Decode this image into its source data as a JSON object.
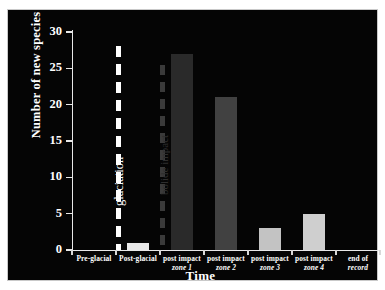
{
  "chart_data": {
    "type": "bar",
    "title": "",
    "xlabel": "Time",
    "ylabel": "Number of new species",
    "categories": [
      "Pre-glacial",
      "Post-glacial",
      "post impact zone 1",
      "post impact zone 2",
      "post impact zone 3",
      "post impact zone 4",
      "end of record"
    ],
    "category_lines": [
      [
        "Pre-glacial",
        ""
      ],
      [
        "Post-glacial",
        ""
      ],
      [
        "post impact",
        "zone 1"
      ],
      [
        "post impact",
        "zone 2"
      ],
      [
        "post impact",
        "zone 3"
      ],
      [
        "post impact",
        "zone 4"
      ],
      [
        "end of",
        "record"
      ]
    ],
    "values": [
      0,
      1,
      27,
      21,
      3,
      5,
      0
    ],
    "bar_colors": [
      "#050505",
      "#e8e8e8",
      "#2a2a2a",
      "#414141",
      "#c3c3c3",
      "#cfcfcf",
      "#050505"
    ],
    "ylim": [
      0,
      30
    ],
    "yticks": [
      0,
      5,
      10,
      15,
      20,
      25,
      30
    ],
    "ytick_labels": [
      "0",
      "5",
      "10",
      "15",
      "20",
      "25",
      "30"
    ],
    "grid": false,
    "legend": false,
    "background_color": "#050505",
    "foreground_color": "#ffffff",
    "annotations": [
      {
        "name": "glaciation",
        "label": "glaciation",
        "style": "dashed-vertical-line",
        "color": "#ffffff",
        "at_category_boundary": 1
      },
      {
        "name": "bolide-impact",
        "label": "bolide impact",
        "style": "dashed-vertical-line",
        "color": "#3a3a3a",
        "at_category_boundary": 2
      }
    ]
  }
}
